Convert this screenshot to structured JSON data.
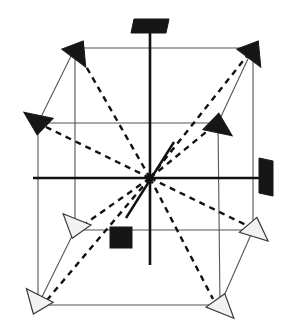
{
  "figure": {
    "type": "line-diagram",
    "background_color": "#ffffff",
    "canvas": {
      "width": 288,
      "height": 336
    }
  },
  "colors": {
    "cell_edge": "#555555",
    "axis": "#111111",
    "dashed_vector": "#111111",
    "filled_marker": "#161616",
    "hollow_marker_fill": "#f2f2f2",
    "hollow_marker_stroke": "#3a3a3a"
  },
  "cell": {
    "name": "cubic-unit-cell",
    "edge_width": 1.1,
    "vertices": {
      "back_top_left": {
        "x": 75,
        "y": 48
      },
      "back_top_right": {
        "x": 253,
        "y": 48
      },
      "front_top_left": {
        "x": 38,
        "y": 123
      },
      "front_top_right": {
        "x": 218,
        "y": 123
      },
      "back_bottom_left": {
        "x": 75,
        "y": 230
      },
      "back_bottom_right": {
        "x": 253,
        "y": 230
      },
      "front_bottom_left": {
        "x": 38,
        "y": 305
      },
      "front_bottom_right": {
        "x": 220,
        "y": 305
      }
    },
    "edges": [
      {
        "name": "back-top",
        "from": "back_top_left",
        "to": "back_top_right"
      },
      {
        "name": "back-bottom",
        "from": "back_bottom_left",
        "to": "back_bottom_right"
      },
      {
        "name": "back-left-vertical",
        "from": "back_top_left",
        "to": "back_bottom_left"
      },
      {
        "name": "back-right-vertical",
        "from": "back_top_right",
        "to": "back_bottom_right"
      },
      {
        "name": "front-top",
        "from": "front_top_left",
        "to": "front_top_right"
      },
      {
        "name": "front-bottom",
        "from": "front_bottom_left",
        "to": "front_bottom_right"
      },
      {
        "name": "front-left-vertical",
        "from": "front_top_left",
        "to": "front_bottom_left"
      },
      {
        "name": "front-right-vertical",
        "from": "front_top_right",
        "to": "front_bottom_right"
      },
      {
        "name": "depth-top-left",
        "from": "front_top_left",
        "to": "back_top_left"
      },
      {
        "name": "depth-top-right",
        "from": "front_top_right",
        "to": "back_top_right"
      },
      {
        "name": "depth-bottom-left",
        "from": "front_bottom_left",
        "to": "back_bottom_left"
      },
      {
        "name": "depth-bottom-right",
        "from": "front_bottom_right",
        "to": "back_bottom_right"
      }
    ]
  },
  "origin": {
    "name": "cell-center",
    "x": 150,
    "y": 178
  },
  "axes": [
    {
      "name": "vertical-axis",
      "x1": 150,
      "y1": 27,
      "x2": 150,
      "y2": 265,
      "width": 2.6
    },
    {
      "name": "horizontal-axis",
      "x1": 33,
      "y1": 178,
      "x2": 264,
      "y2": 178,
      "width": 2.6
    },
    {
      "name": "diagonal-axis",
      "x1": 174,
      "y1": 142,
      "x2": 126,
      "y2": 218,
      "width": 2.4
    }
  ],
  "dashed_vectors": [
    {
      "name": "diagonal-to-back-top-left",
      "x1": 150,
      "y1": 178,
      "x2": 79,
      "y2": 54,
      "label": "[-1 1 1]"
    },
    {
      "name": "diagonal-to-back-top-right",
      "x1": 150,
      "y1": 178,
      "x2": 247,
      "y2": 56,
      "label": "[1 1 1]"
    },
    {
      "name": "diagonal-to-front-top-left",
      "x1": 150,
      "y1": 178,
      "x2": 46,
      "y2": 127,
      "label": "[-1 1 -1]"
    },
    {
      "name": "diagonal-to-front-top-right",
      "x1": 150,
      "y1": 178,
      "x2": 211,
      "y2": 128,
      "label": "[1 1 -1]"
    },
    {
      "name": "diagonal-to-front-bottom-left",
      "x1": 150,
      "y1": 178,
      "x2": 47,
      "y2": 300,
      "label": "[-1 -1 -1]"
    },
    {
      "name": "diagonal-to-front-bottom-right",
      "x1": 150,
      "y1": 178,
      "x2": 213,
      "y2": 299,
      "label": "[1 -1 -1]"
    },
    {
      "name": "diagonal-to-back-bottom-left",
      "x1": 150,
      "y1": 178,
      "x2": 82,
      "y2": 226,
      "label": "[-1 -1 1]"
    },
    {
      "name": "diagonal-to-back-bottom-right",
      "x1": 150,
      "y1": 178,
      "x2": 248,
      "y2": 226,
      "label": "[1 -1 1]"
    }
  ],
  "markers": [
    {
      "name": "marker-axis-top-parallelogram",
      "shape": "parallelogram",
      "fill": "solid",
      "x": 150,
      "y": 26,
      "rotation": 0
    },
    {
      "name": "marker-axis-right-parallelogram",
      "shape": "parallelogram",
      "fill": "solid",
      "x": 266,
      "y": 177,
      "rotation": 90
    },
    {
      "name": "marker-center-square",
      "shape": "square",
      "fill": "solid",
      "x": 121,
      "y": 238
    },
    {
      "name": "marker-back-top-left-arrow",
      "shape": "triangle",
      "fill": "solid",
      "x": 77,
      "y": 50,
      "rotation": 35
    },
    {
      "name": "marker-back-top-right-arrow",
      "shape": "triangle",
      "fill": "solid",
      "x": 252,
      "y": 50,
      "rotation": 35
    },
    {
      "name": "marker-front-top-left-arrow",
      "shape": "triangle",
      "fill": "solid",
      "x": 39,
      "y": 124,
      "rotation": 190
    },
    {
      "name": "marker-front-top-right-arrow",
      "shape": "triangle",
      "fill": "solid",
      "x": 217,
      "y": 124,
      "rotation": 10
    },
    {
      "name": "marker-back-bottom-left-arrow",
      "shape": "triangle",
      "fill": "hollow",
      "x": 76,
      "y": 228,
      "rotation": 200
    },
    {
      "name": "marker-back-bottom-right-arrow",
      "shape": "triangle",
      "fill": "hollow",
      "x": 254,
      "y": 228,
      "rotation": 15
    },
    {
      "name": "marker-front-bottom-left-arrow",
      "shape": "triangle",
      "fill": "hollow",
      "x": 38,
      "y": 304,
      "rotation": 205
    },
    {
      "name": "marker-front-bottom-right-arrow",
      "shape": "triangle",
      "fill": "hollow",
      "x": 221,
      "y": 304,
      "rotation": 20
    }
  ]
}
